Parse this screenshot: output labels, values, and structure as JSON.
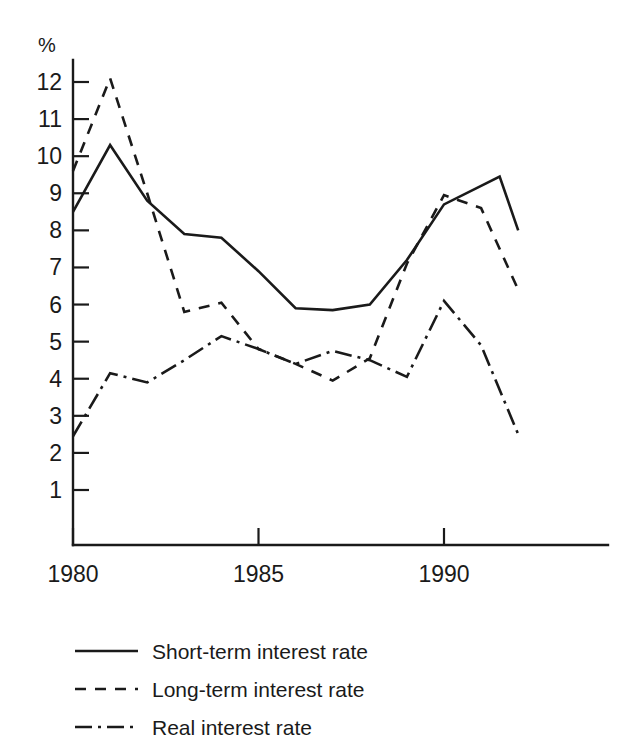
{
  "chart_data": {
    "type": "line",
    "title": "",
    "subtitle": "",
    "xlabel": "",
    "ylabel": "%",
    "y_unit_label": "%",
    "xlim": [
      1980,
      1992
    ],
    "ylim": [
      0,
      12.5
    ],
    "grid": false,
    "legend_position": "bottom-left",
    "y_ticks": [
      12,
      11,
      10,
      9,
      8,
      7,
      6,
      5,
      4,
      3,
      2,
      1
    ],
    "y_tick_labels": [
      "12",
      "11",
      "10",
      "9",
      "8",
      "7",
      "6",
      "5",
      "4",
      "3",
      "2",
      "1"
    ],
    "x_ticks": [
      1980,
      1985,
      1990
    ],
    "x_tick_labels": [
      "1980",
      "1985",
      "1990"
    ],
    "x": [
      1980,
      1981,
      1982,
      1983,
      1984,
      1985,
      1986,
      1987,
      1988,
      1989,
      1990,
      1991,
      1992
    ],
    "series": [
      {
        "name": "Short-term interest rate",
        "style": "solid",
        "color": "#1a1a1a",
        "values": [
          8.5,
          10.3,
          8.8,
          7.9,
          7.8,
          6.9,
          5.9,
          5.85,
          6.0,
          7.2,
          8.7,
          9.2,
          8.0
        ],
        "extra_points": [
          {
            "x": 1991.5,
            "y": 9.45
          }
        ]
      },
      {
        "name": "Long-term interest rate",
        "style": "dashed",
        "color": "#1a1a1a",
        "values": [
          9.6,
          12.1,
          9.0,
          5.8,
          6.05,
          4.8,
          4.4,
          3.95,
          4.55,
          7.1,
          8.95,
          8.6,
          6.4
        ]
      },
      {
        "name": "Real interest rate",
        "style": "dash-dot",
        "color": "#1a1a1a",
        "values": [
          2.45,
          4.15,
          3.9,
          4.5,
          5.15,
          4.8,
          4.4,
          4.75,
          4.5,
          4.05,
          6.1,
          4.9,
          2.5
        ]
      }
    ]
  },
  "legend": {
    "items": [
      {
        "label": "Short-term interest rate",
        "style": "solid"
      },
      {
        "label": "Long-term interest rate",
        "style": "dashed"
      },
      {
        "label": "Real interest rate",
        "style": "dash-dot"
      }
    ]
  }
}
